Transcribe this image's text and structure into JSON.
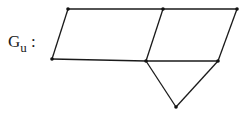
{
  "graph": {
    "label_main": "G",
    "label_sub": "u",
    "label_colon": " :",
    "nodes": [
      {
        "id": "a",
        "x": 68,
        "y": 9
      },
      {
        "id": "b",
        "x": 163,
        "y": 9
      },
      {
        "id": "c",
        "x": 237,
        "y": 9
      },
      {
        "id": "d",
        "x": 52,
        "y": 59
      },
      {
        "id": "e",
        "x": 146,
        "y": 61
      },
      {
        "id": "f",
        "x": 218,
        "y": 61
      },
      {
        "id": "g",
        "x": 176,
        "y": 107
      }
    ],
    "edges": [
      [
        "a",
        "b"
      ],
      [
        "b",
        "c"
      ],
      [
        "a",
        "d"
      ],
      [
        "b",
        "e"
      ],
      [
        "c",
        "f"
      ],
      [
        "d",
        "e"
      ],
      [
        "e",
        "f"
      ],
      [
        "e",
        "g"
      ],
      [
        "f",
        "g"
      ]
    ],
    "colors": {
      "stroke": "#1a1a1a",
      "node": "#111111"
    }
  }
}
